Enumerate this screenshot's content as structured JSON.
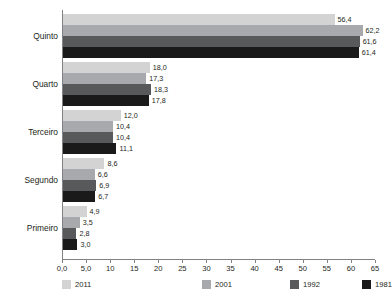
{
  "chart_data": {
    "type": "bar",
    "orientation": "horizontal",
    "title": "",
    "subtitle": "",
    "xlabel": "",
    "ylabel": "",
    "xlim": [
      0,
      65
    ],
    "grid": false,
    "legend_position": "bottom",
    "categories": [
      "Quinto",
      "Quarto",
      "Terceiro",
      "Segundo",
      "Primeiro"
    ],
    "series": [
      {
        "name": "2011",
        "color": "#d3d3d3",
        "values": [
          56.4,
          18.0,
          12.0,
          8.6,
          4.9
        ],
        "labels": [
          "56,4",
          "18,0",
          "12,0",
          "8,6",
          "4,9"
        ]
      },
      {
        "name": "2001",
        "color": "#a7a9ac",
        "values": [
          62.2,
          17.3,
          10.4,
          6.6,
          3.5
        ],
        "labels": [
          "62,2",
          "17,3",
          "10,4",
          "6,6",
          "3,5"
        ]
      },
      {
        "name": "1992",
        "color": "#58595b",
        "values": [
          61.6,
          18.3,
          10.4,
          6.9,
          2.8
        ],
        "labels": [
          "61,6",
          "18,3",
          "10,4",
          "6,9",
          "2,8"
        ]
      },
      {
        "name": "1981",
        "color": "#1a1a1a",
        "values": [
          61.4,
          17.8,
          11.1,
          6.7,
          3.0
        ],
        "labels": [
          "61,4",
          "17,8",
          "11,1",
          "6,7",
          "3,0"
        ]
      }
    ],
    "x_ticks": [
      {
        "value": 0,
        "label": "0,0"
      },
      {
        "value": 5,
        "label": "5,0"
      },
      {
        "value": 10,
        "label": "10"
      },
      {
        "value": 15,
        "label": "15"
      },
      {
        "value": 20,
        "label": "20"
      },
      {
        "value": 25,
        "label": "25"
      },
      {
        "value": 30,
        "label": "30"
      },
      {
        "value": 35,
        "label": "35"
      },
      {
        "value": 40,
        "label": "40"
      },
      {
        "value": 45,
        "label": "45"
      },
      {
        "value": 50,
        "label": "50"
      },
      {
        "value": 55,
        "label": "55"
      },
      {
        "value": 60,
        "label": "60"
      },
      {
        "value": 65,
        "label": "65"
      }
    ],
    "axis_color": "#808285",
    "text_color": "#231f20",
    "background": "#ffffff"
  }
}
